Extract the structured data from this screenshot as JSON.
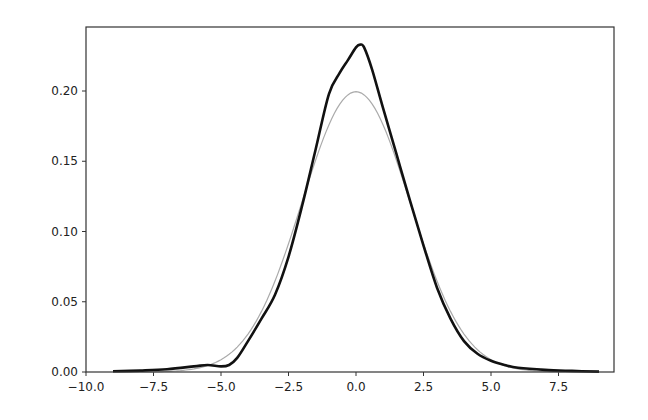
{
  "chart_data": {
    "type": "line",
    "title": "",
    "xlabel": "",
    "ylabel": "",
    "xlim": [
      -10.0,
      9.8
    ],
    "ylim": [
      0.0,
      0.245
    ],
    "grid": false,
    "legend": null,
    "xticks": [
      -10.0,
      -7.5,
      -5.0,
      -2.5,
      0.0,
      2.5,
      5.0,
      7.5
    ],
    "xtick_labels": [
      "−10.0",
      "−7.5",
      "−5.0",
      "−2.5",
      "0.0",
      "2.5",
      "5.0",
      "7.5"
    ],
    "yticks": [
      0.0,
      0.05,
      0.1,
      0.15,
      0.2
    ],
    "ytick_labels": [
      "0.00",
      "0.05",
      "0.10",
      "0.15",
      "0.20"
    ],
    "series": [
      {
        "name": "empirical density (KDE)",
        "color": "#111111",
        "width": 2.6,
        "x": [
          -9.0,
          -8.0,
          -7.0,
          -6.0,
          -5.5,
          -5.0,
          -4.7,
          -4.4,
          -4.0,
          -3.5,
          -3.0,
          -2.5,
          -2.0,
          -1.5,
          -1.0,
          -0.6,
          -0.3,
          0.0,
          0.15,
          0.3,
          0.6,
          1.0,
          1.5,
          2.0,
          2.5,
          3.0,
          3.5,
          4.0,
          4.5,
          5.0,
          5.5,
          6.0,
          7.0,
          8.0,
          9.0
        ],
        "y": [
          0.0005,
          0.001,
          0.002,
          0.004,
          0.005,
          0.004,
          0.005,
          0.01,
          0.022,
          0.038,
          0.055,
          0.082,
          0.118,
          0.158,
          0.198,
          0.213,
          0.222,
          0.231,
          0.233,
          0.231,
          0.215,
          0.188,
          0.155,
          0.122,
          0.09,
          0.06,
          0.038,
          0.022,
          0.013,
          0.008,
          0.005,
          0.003,
          0.0015,
          0.0008,
          0.0003
        ]
      },
      {
        "name": "normal pdf (mu=0, sigma=2)",
        "color": "#aaaaaa",
        "width": 1.2,
        "mu": 0.0,
        "sigma": 2.0,
        "x_range": [
          -9.0,
          9.0
        ]
      }
    ]
  }
}
